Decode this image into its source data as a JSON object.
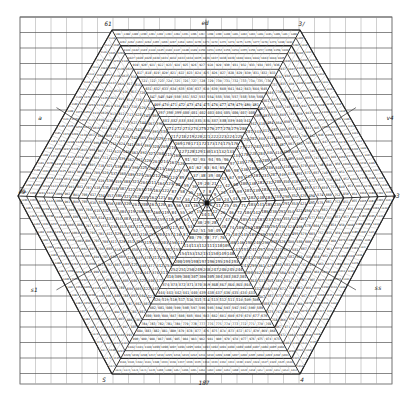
{
  "diagram": {
    "type": "hexagonal-number-spiral",
    "colors": {
      "paper": "#ffffff",
      "grid_major": "#555555",
      "grid_minor": "#b0b0b0",
      "ink": "#1a1a1a",
      "row_band": "#2a2a2a"
    },
    "paper": {
      "x0": 20,
      "y0": 17,
      "x1": 392,
      "y1": 384,
      "cell": 15.5
    },
    "hexagon": {
      "center": [
        207,
        203
      ],
      "vertices": [
        [
          112,
          30
        ],
        [
          300,
          30
        ],
        [
          395,
          196
        ],
        [
          300,
          374
        ],
        [
          112,
          374
        ],
        [
          18,
          196
        ]
      ],
      "rings": 22
    },
    "vertex_labels": [
      {
        "text": "61",
        "x": 108,
        "y": 26
      },
      {
        "text": "ed",
        "x": 205,
        "y": 25
      },
      {
        "text": "3/",
        "x": 302,
        "y": 26
      },
      {
        "text": "v4",
        "x": 390,
        "y": 120
      },
      {
        "text": "e9",
        "x": 22,
        "y": 194
      },
      {
        "text": "e3",
        "x": 396,
        "y": 198
      },
      {
        "text": "a",
        "x": 40,
        "y": 120
      },
      {
        "text": "s1",
        "x": 34,
        "y": 292
      },
      {
        "text": "ss",
        "x": 378,
        "y": 290
      },
      {
        "text": "S",
        "x": 104,
        "y": 382
      },
      {
        "text": "187",
        "x": 204,
        "y": 385
      },
      {
        "text": "4",
        "x": 302,
        "y": 382
      }
    ],
    "number_start": 1
  }
}
